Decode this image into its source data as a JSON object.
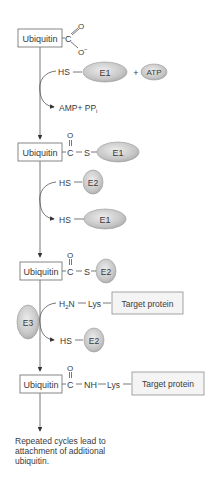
{
  "diagram": {
    "steps": [
      {
        "box": "Ubiquitin",
        "group_c": "C",
        "o_double": "O",
        "o_minus": "O",
        "o_charge": "−"
      },
      {
        "reactant": "HS",
        "enzyme": "E1",
        "plus": "+",
        "cofactor": "ATP",
        "product": "AMP+ PP",
        "product_sub": "i"
      },
      {
        "box": "Ubiquitin",
        "group_c": "C",
        "o": "O",
        "s": "S",
        "enzyme": "E1"
      },
      {
        "reactant_top": "HS",
        "enzyme_top": "E2",
        "reactant_bottom": "HS",
        "enzyme_bottom": "E1"
      },
      {
        "box": "Ubiquitin",
        "group_c": "C",
        "o": "O",
        "s": "S",
        "enzyme": "E2"
      },
      {
        "amine": "H",
        "amine_sub": "2",
        "amine_n": "N",
        "lys": "Lys",
        "target": "Target protein",
        "ligase": "E3",
        "reactant_bottom": "HS",
        "enzyme_bottom": "E2"
      },
      {
        "box": "Ubiquitin",
        "group_c": "C",
        "o": "O",
        "nh": "NH",
        "lys": "Lys",
        "target": "Target protein"
      }
    ],
    "footnote": [
      "Repeated cycles lead to",
      "attachment of additional",
      "ubiquitin."
    ]
  },
  "colors": {
    "oval_fill": "#c8c8c8",
    "oval_stroke": "#9a9a9a",
    "line": "#555555",
    "box_border": "#7a7a7a"
  }
}
